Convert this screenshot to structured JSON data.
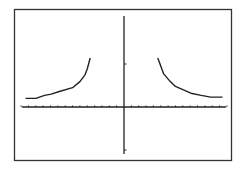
{
  "chart_data": {
    "type": "line",
    "title": "",
    "xlabel": "",
    "ylabel": "",
    "xlim": [
      -14,
      14
    ],
    "ylim": [
      -1.5,
      1.75
    ],
    "x_tick_spacing": 1,
    "y_tick_spacing": 1,
    "grid": false,
    "legend": null,
    "series": [
      {
        "name": "left-branch",
        "x": [
          -13.4,
          -12,
          -10.8,
          -9.9,
          -8.8,
          -7.0,
          -6.0,
          -5.3,
          -5.0,
          -4.6
        ],
        "y": [
          0.2,
          0.2,
          0.27,
          0.3,
          0.36,
          0.45,
          0.59,
          0.75,
          0.89,
          1.14
        ]
      },
      {
        "name": "right-branch",
        "x": [
          4.6,
          5.4,
          6.3,
          7.0,
          9.1,
          10.5,
          11.8,
          13.4
        ],
        "y": [
          1.14,
          0.77,
          0.59,
          0.48,
          0.32,
          0.27,
          0.23,
          0.23
        ]
      }
    ]
  },
  "frame": {
    "stroke": "#333333",
    "background": "#ffffff"
  },
  "colors": {
    "axis": "#222222",
    "curve": "#222222"
  }
}
